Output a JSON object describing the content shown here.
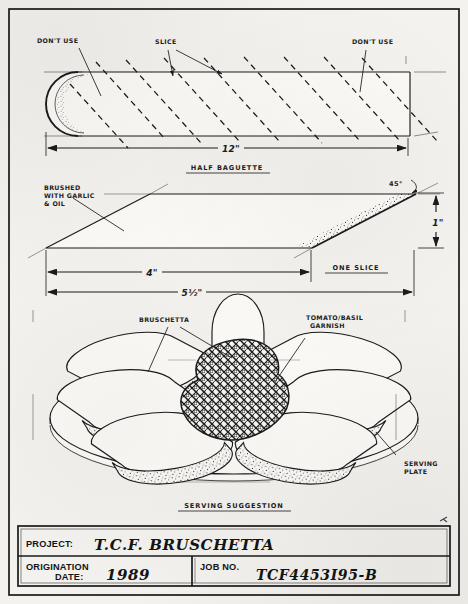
{
  "drawing": {
    "sheet_title": "T.C.F. BRUSCHETTA",
    "views": {
      "top": {
        "caption": "HALF BAGUETTE",
        "labels": {
          "left_no_use": "DON'T USE",
          "slice": "SLICE",
          "right_no_use": "DON'T USE"
        },
        "dimensions": [
          {
            "name": "overall-length",
            "value": "12\""
          }
        ]
      },
      "slice": {
        "caption": "ONE SLICE",
        "labels": {
          "brushed": "BRUSHED\nWITH GARLIC\n& OIL",
          "brushed_line1": "BRUSHED",
          "brushed_line2": "WITH GARLIC",
          "brushed_line3": "& OIL",
          "angle": "45°"
        },
        "dimensions": [
          {
            "name": "thickness",
            "value": "1\""
          },
          {
            "name": "face-length",
            "value": "4\""
          },
          {
            "name": "overall-length",
            "value": "5½\""
          }
        ]
      },
      "serving": {
        "caption": "SERVING SUGGESTION",
        "labels": {
          "bruschetta": "BRUSCHETTA",
          "garnish_line1": "TOMATO/BASIL",
          "garnish_line2": "GARNISH",
          "plate_line1": "SERVING",
          "plate_line2": "PLATE"
        }
      }
    }
  },
  "title_block": {
    "project_label": "PROJECT:",
    "project_value": "T.C.F. BRUSCHETTA",
    "origination_label_line1": "ORIGINATION",
    "origination_label_line2": "DATE:",
    "origination_value": "1989",
    "job_label": "JOB NO.",
    "job_value": "TCF4453I95-B"
  },
  "palette": {
    "paper": "#f3f2ee",
    "ink": "#1b1b1b",
    "crust_fill": "#fbfaf7"
  }
}
